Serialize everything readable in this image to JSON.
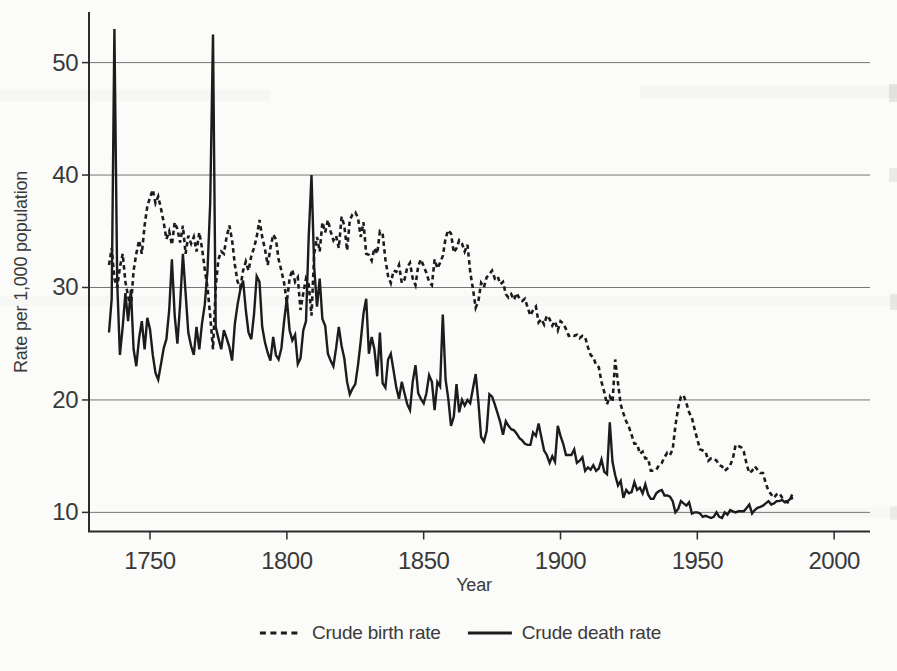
{
  "figure": {
    "ink_color": "#1c1c1c",
    "grid_color": "#777777",
    "background": "#fbfbf9"
  },
  "chart_data": {
    "type": "line",
    "title": "",
    "xlabel": "Year",
    "ylabel": "Rate per 1,000 population",
    "grid": "horizontal-only",
    "legend_position": "bottom-center",
    "x_start_year": 1735,
    "x_end_year": 1985,
    "xticks": [
      1750,
      1800,
      1850,
      1900,
      1950,
      2000
    ],
    "yticks": [
      10,
      20,
      30,
      40,
      50
    ],
    "xlim": [
      1727.7,
      2013.1
    ],
    "ylim": [
      8.3,
      54.5
    ],
    "series": [
      {
        "name": "Crude birth rate",
        "style": "dashed",
        "color": "#1c1c1c",
        "values": [
          32.0,
          33.5,
          30.8,
          30.0,
          31.8,
          33.0,
          30.5,
          29.2,
          28.3,
          31.5,
          33.0,
          34.2,
          33.0,
          35.5,
          37.2,
          38.0,
          38.7,
          37.5,
          38.1,
          37.0,
          35.8,
          34.3,
          35.0,
          33.8,
          35.8,
          35.2,
          34.0,
          35.5,
          33.0,
          34.6,
          33.9,
          34.5,
          33.2,
          34.9,
          33.5,
          31.6,
          30.0,
          27.5,
          24.5,
          30.0,
          32.5,
          33.2,
          33.0,
          34.5,
          35.5,
          34.2,
          32.0,
          30.5,
          30.0,
          31.5,
          32.3,
          31.5,
          32.8,
          33.5,
          34.5,
          36.0,
          34.5,
          33.4,
          32.0,
          33.5,
          34.7,
          34.3,
          32.5,
          31.5,
          30.4,
          28.7,
          30.8,
          31.6,
          30.5,
          30.9,
          28.0,
          29.5,
          30.8,
          30.3,
          27.5,
          33.0,
          34.5,
          33.2,
          35.8,
          34.9,
          36.0,
          35.0,
          34.2,
          34.6,
          33.5,
          36.3,
          35.5,
          33.3,
          36.0,
          36.5,
          36.7,
          36.2,
          34.5,
          35.8,
          33.0,
          32.9,
          32.4,
          33.5,
          33.0,
          35.0,
          34.8,
          32.5,
          31.0,
          30.4,
          31.5,
          31.4,
          32.0,
          30.4,
          30.7,
          31.8,
          32.2,
          30.8,
          30.2,
          31.9,
          32.5,
          31.9,
          31.3,
          30.5,
          30.2,
          32.5,
          31.7,
          32.2,
          32.8,
          34.4,
          35.1,
          34.8,
          33.1,
          33.5,
          34.2,
          33.9,
          33.2,
          33.8,
          31.4,
          29.9,
          28.2,
          28.8,
          30.4,
          30.0,
          30.9,
          31.2,
          31.5,
          30.8,
          31.0,
          30.3,
          30.5,
          29.4,
          29.1,
          29.4,
          28.9,
          29.5,
          29.0,
          28.8,
          29.0,
          28.2,
          27.5,
          28.0,
          28.3,
          26.9,
          27.2,
          26.7,
          27.5,
          27.2,
          26.6,
          27.0,
          26.2,
          27.0,
          26.8,
          26.3,
          25.7,
          25.8,
          25.7,
          25.8,
          25.5,
          25.7,
          25.6,
          24.7,
          24.0,
          23.8,
          23.1,
          22.9,
          21.6,
          20.7,
          19.6,
          20.3,
          19.8,
          23.6,
          21.5,
          19.6,
          18.8,
          18.1,
          17.6,
          16.9,
          16.1,
          16.1,
          15.2,
          15.4,
          14.8,
          14.8,
          13.7,
          13.7,
          13.8,
          14.2,
          14.4,
          14.9,
          15.3,
          15.1,
          15.6,
          17.7,
          19.3,
          20.3,
          20.4,
          19.7,
          18.9,
          18.4,
          17.4,
          16.5,
          15.6,
          15.5,
          15.4,
          14.6,
          14.8,
          14.8,
          14.6,
          14.2,
          14.1,
          13.7,
          13.9,
          14.2,
          14.8,
          16.0,
          15.9,
          15.8,
          15.4,
          14.3,
          13.5,
          13.7,
          14.1,
          13.8,
          13.5,
          13.5,
          12.6,
          11.9,
          11.6,
          11.3,
          11.6,
          11.7,
          11.3,
          11.0,
          10.9,
          11.2,
          11.8
        ]
      },
      {
        "name": "Crude death rate",
        "style": "solid",
        "color": "#1c1c1c",
        "values": [
          26.0,
          29.0,
          53.0,
          30.5,
          24.0,
          26.5,
          29.5,
          27.0,
          29.8,
          24.5,
          23.0,
          25.5,
          27.0,
          24.5,
          27.3,
          26.3,
          24.0,
          22.4,
          21.8,
          23.2,
          24.6,
          25.4,
          28.0,
          32.5,
          27.5,
          25.0,
          28.5,
          33.0,
          29.5,
          26.0,
          24.8,
          24.0,
          26.5,
          24.5,
          26.8,
          28.5,
          31.5,
          37.5,
          52.5,
          26.5,
          25.5,
          24.5,
          26.2,
          25.5,
          24.7,
          23.5,
          26.8,
          28.5,
          29.8,
          30.6,
          28.0,
          26.0,
          25.4,
          27.6,
          31.0,
          30.5,
          26.5,
          25.1,
          24.2,
          23.5,
          25.6,
          24.0,
          23.6,
          24.6,
          27.0,
          29.0,
          26.2,
          25.3,
          25.8,
          23.2,
          23.7,
          26.2,
          27.0,
          34.5,
          40.0,
          31.8,
          28.3,
          30.8,
          27.2,
          26.6,
          24.1,
          23.5,
          23.0,
          24.6,
          26.5,
          24.8,
          23.7,
          21.6,
          20.5,
          21.0,
          21.4,
          23.1,
          25.2,
          27.7,
          29.0,
          24.1,
          25.6,
          24.5,
          22.1,
          26.0,
          21.5,
          21.1,
          23.6,
          24.1,
          22.6,
          21.1,
          20.1,
          21.6,
          20.6,
          19.6,
          19.1,
          21.6,
          23.1,
          20.6,
          20.1,
          19.7,
          20.6,
          22.2,
          21.6,
          19.1,
          21.6,
          21.2,
          27.6,
          21.8,
          20.1,
          17.7,
          18.5,
          21.4,
          18.9,
          20.0,
          19.5,
          20.0,
          19.7,
          21.0,
          22.3,
          19.8,
          16.7,
          16.3,
          17.2,
          20.5,
          20.3,
          19.6,
          18.8,
          18.0,
          16.9,
          18.1,
          17.7,
          17.4,
          17.3,
          17.0,
          16.6,
          16.4,
          16.1,
          16.0,
          16.0,
          17.1,
          16.8,
          17.9,
          16.7,
          15.5,
          15.1,
          14.4,
          15.0,
          14.5,
          17.7,
          16.8,
          16.1,
          15.1,
          15.1,
          15.1,
          15.6,
          14.4,
          14.6,
          14.9,
          13.7,
          14.0,
          13.8,
          14.2,
          13.7,
          13.9,
          14.7,
          13.6,
          13.4,
          18.0,
          14.5,
          13.3,
          12.4,
          12.8,
          11.3,
          12.0,
          11.7,
          11.8,
          12.7,
          12.0,
          12.2,
          11.7,
          12.5,
          11.6,
          11.2,
          11.2,
          11.7,
          11.9,
          12.0,
          11.5,
          11.5,
          11.4,
          11.0,
          10.0,
          10.3,
          11.0,
          10.8,
          10.6,
          10.9,
          9.9,
          10.0,
          10.0,
          9.9,
          9.6,
          9.7,
          9.6,
          9.5,
          9.6,
          10.0,
          9.6,
          9.5,
          10.0,
          9.8,
          10.2,
          10.1,
          10.0,
          10.1,
          10.1,
          10.1,
          10.4,
          10.7,
          9.9,
          10.2,
          10.4,
          10.5,
          10.6,
          10.8,
          11.0,
          10.7,
          10.8,
          11.0,
          11.0,
          11.1,
          10.9,
          11.0,
          11.2,
          11.3
        ]
      }
    ]
  }
}
